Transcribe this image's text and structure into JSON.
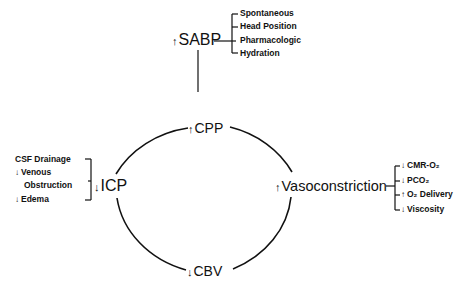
{
  "diagram": {
    "nodes": {
      "sabp": {
        "arrow": "↑",
        "label": "SABP"
      },
      "cpp": {
        "arrow": "↑",
        "label": "CPP"
      },
      "icp": {
        "arrow": "↓",
        "label": "ICP"
      },
      "vasoconstriction": {
        "arrow": "↑",
        "label": "Vasoconstriction"
      },
      "cbv": {
        "arrow": "↓",
        "label": "CBV"
      }
    },
    "sabp_factors": [
      {
        "label": "Spontaneous"
      },
      {
        "label": "Head Position"
      },
      {
        "label": "Pharmacologic"
      },
      {
        "label": "Hydration"
      }
    ],
    "icp_factors": [
      {
        "arrow": "",
        "label": "CSF Drainage"
      },
      {
        "arrow": "↓",
        "label": "Venous"
      },
      {
        "arrow": "",
        "label": "Obstruction"
      },
      {
        "arrow": "↓",
        "label": "Edema"
      }
    ],
    "vaso_factors": [
      {
        "arrow": "↓",
        "label": "CMR-O₂"
      },
      {
        "arrow": "↓",
        "label": "PCO₂"
      },
      {
        "arrow": "↑",
        "label": "O₂ Delivery"
      },
      {
        "arrow": "↓",
        "label": "Viscosity"
      }
    ],
    "line_color": "#111111"
  }
}
